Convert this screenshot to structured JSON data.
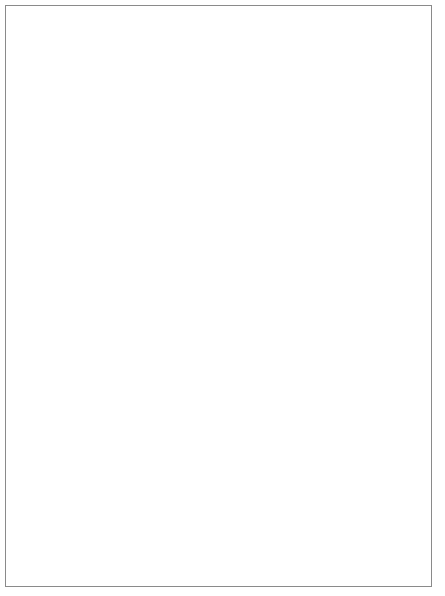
{
  "figure": {
    "background_color": "#ffffff",
    "border_color": "#8a8a8a",
    "line_color": "#000000"
  },
  "chart_data": [
    {
      "id": "top",
      "type": "line",
      "title": "",
      "xlabel": "Years",
      "ylabel": "",
      "xlim": [
        0,
        8
      ],
      "ylim": [
        1000,
        2000
      ],
      "grid": false,
      "legend": "inline-annotations",
      "x_ticks": [
        {
          "value": 0,
          "label": "0"
        },
        {
          "value": 1,
          "label": "1"
        },
        {
          "value": 2,
          "label": "2"
        },
        {
          "value": 8,
          "label": "8"
        }
      ],
      "y_ticks": [
        {
          "value": 1000,
          "label": "$1,000"
        },
        {
          "value": 2000,
          "label": "$2,000"
        }
      ],
      "reference_lines": [],
      "series": [
        {
          "name": "9.05%/yr",
          "label": "9.05%/yr",
          "rate_percent": 9.05,
          "start_year": 0,
          "start_value": 1000,
          "end_year": 8,
          "end_value": 2000,
          "x": [
            0,
            0.5,
            1,
            1.5,
            2,
            2.5,
            3,
            3.5,
            4,
            4.5,
            5,
            5.5,
            6,
            6.5,
            7,
            7.5,
            8
          ],
          "y": [
            1000,
            1044,
            1090,
            1139,
            1189,
            1241,
            1296,
            1353,
            1413,
            1476,
            1541,
            1609,
            1680,
            1754,
            1832,
            1913,
            2000
          ],
          "label_x": 3.05,
          "label_y": 1385,
          "label_rotation": -21
        },
        {
          "name": "10.4%/yr",
          "label": "10.4%/yr",
          "rate_percent": 10.4,
          "start_year": 1,
          "start_value": 1000,
          "end_year": 8,
          "end_value": 2000,
          "x": [
            1,
            1.5,
            2,
            2.5,
            3,
            3.5,
            4,
            4.5,
            5,
            5.5,
            6,
            6.5,
            7,
            7.5,
            8
          ],
          "y": [
            1000,
            1051,
            1104,
            1161,
            1220,
            1282,
            1347,
            1416,
            1488,
            1564,
            1643,
            1727,
            1815,
            1907,
            2000
          ],
          "label_x": 3.95,
          "label_y": 1302,
          "label_rotation": -24
        },
        {
          "name": "12.25%/yr",
          "label": "12.25%/yr",
          "rate_percent": 12.25,
          "start_year": 2,
          "start_value": 1000,
          "end_year": 8,
          "end_value": 2000,
          "x": [
            2,
            2.5,
            3,
            3.5,
            4,
            4.5,
            5,
            5.5,
            6,
            6.5,
            7,
            7.5,
            8
          ],
          "y": [
            1000,
            1059,
            1122,
            1189,
            1259,
            1334,
            1414,
            1497,
            1587,
            1681,
            1780,
            1886,
            2000
          ],
          "label_x": 4.9,
          "label_y": 1222,
          "label_rotation": -27
        }
      ]
    },
    {
      "id": "bottom",
      "type": "line",
      "title": "",
      "xlabel": "Years",
      "ylabel": "",
      "xlim": [
        0,
        8
      ],
      "ylim": [
        800,
        2000
      ],
      "grid": false,
      "legend": "inline-annotations",
      "x_ticks": [
        {
          "value": 0,
          "label": "0"
        },
        {
          "value": 2,
          "label": "2"
        },
        {
          "value": 4,
          "label": ""
        },
        {
          "value": 6,
          "label": ""
        },
        {
          "value": 8,
          "label": "8"
        }
      ],
      "y_ticks": [
        {
          "value": 800,
          "label": "$800"
        },
        {
          "value": 1000,
          "label": "$1,000"
        },
        {
          "value": 2000,
          "label": "$2,000"
        }
      ],
      "reference_lines": [
        {
          "axis": "y",
          "value": 1000,
          "style": "solid"
        }
      ],
      "series": [
        {
          "name": "15%/yr",
          "label": "15%/yr",
          "rate_percent": 15,
          "start_year": 0,
          "start_value": 1000,
          "end_year": 8,
          "end_value": 2000,
          "x": [
            0,
            0.5,
            1,
            1.5,
            2,
            2.5,
            3,
            3.5,
            4,
            4.5,
            5,
            5.5,
            6,
            6.5,
            7,
            7.5,
            8
          ],
          "y": [
            1000,
            1042,
            1085,
            1129,
            1174,
            1221,
            1270,
            1321,
            1375,
            1432,
            1492,
            1556,
            1625,
            1700,
            1782,
            1879,
            2000
          ],
          "label_x": 3.05,
          "label_y": 1405,
          "label_rotation": -15
        },
        {
          "name": "25%/yr",
          "label": "25%/yr",
          "rate_percent": 25,
          "start_year": 0,
          "start_value": 1000,
          "min_year": 2,
          "min_value": 800,
          "end_year": 8,
          "end_value": 2000,
          "x": [
            0,
            0.5,
            1,
            1.5,
            2,
            2.5,
            3,
            3.5,
            4,
            4.5,
            5,
            5.5,
            6,
            6.5,
            7,
            7.5,
            8
          ],
          "y": [
            1000,
            948,
            900,
            850,
            800,
            812,
            846,
            898,
            966,
            1050,
            1150,
            1270,
            1410,
            1570,
            1730,
            1880,
            2000
          ],
          "label_x": 5.25,
          "label_y": 1255,
          "label_rotation": -30
        }
      ]
    }
  ]
}
